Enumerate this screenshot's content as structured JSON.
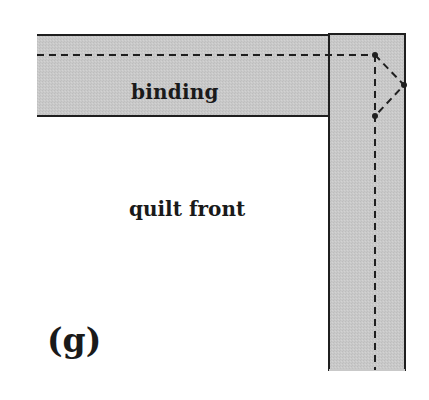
{
  "diagram": {
    "step_label": "(g)",
    "labels": {
      "binding": "binding",
      "quilt_front": "quilt front"
    },
    "colors": {
      "background": "#ffffff",
      "binding_fill": "#c9c9c9",
      "outline": "#1f1f1f",
      "stitch_line": "#1f1f1f",
      "text": "#1a1a1a"
    },
    "shapes": {
      "horizontal_binding": {
        "x": 37,
        "y": 35,
        "width": 300,
        "height": 81
      },
      "vertical_binding": {
        "x": 329,
        "y": 34,
        "width": 76,
        "height": 336
      },
      "stitch_horizontal": {
        "x1": 37,
        "y1": 55,
        "x2": 375,
        "y2": 55
      },
      "stitch_vertical": {
        "x1": 375,
        "y1": 55,
        "x2": 375,
        "y2": 370
      },
      "miter_fold": [
        [
          375,
          55
        ],
        [
          404,
          85
        ],
        [
          375,
          116
        ]
      ],
      "pivot_dots": [
        [
          375,
          55
        ],
        [
          404,
          85
        ],
        [
          375,
          116
        ]
      ]
    }
  }
}
